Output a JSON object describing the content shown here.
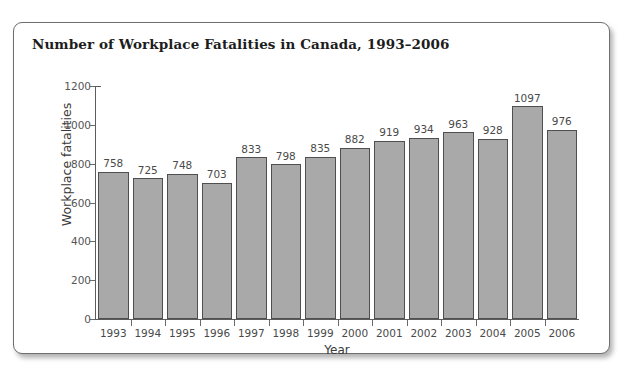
{
  "card": {
    "accent_color": "#a9a9a9",
    "border_color": "#6e6e6e",
    "background": "#ffffff"
  },
  "chart_data": {
    "type": "bar",
    "title": "Number of Workplace Fatalities in Canada, 1993–2006",
    "xlabel": "Year",
    "ylabel": "Workplace fatalities",
    "categories": [
      "1993",
      "1994",
      "1995",
      "1996",
      "1997",
      "1998",
      "1999",
      "2000",
      "2001",
      "2002",
      "2003",
      "2004",
      "2005",
      "2006"
    ],
    "values": [
      758,
      725,
      748,
      703,
      833,
      798,
      835,
      882,
      919,
      934,
      963,
      928,
      1097,
      976
    ],
    "data_labels": [
      "758",
      "725",
      "748",
      "703",
      "833",
      "798",
      "835",
      "882",
      "919",
      "934",
      "963",
      "928",
      "1097",
      "976"
    ],
    "ylim": [
      0,
      1200
    ],
    "yticks": [
      0,
      200,
      400,
      600,
      800,
      1000,
      1200
    ],
    "ytick_labels": [
      "0",
      "200",
      "400",
      "600",
      "800",
      "1000",
      "1200"
    ],
    "grid": false,
    "legend": null,
    "bar_color": "#a9a9a9",
    "bar_edge_color": "#4f4f4f"
  }
}
